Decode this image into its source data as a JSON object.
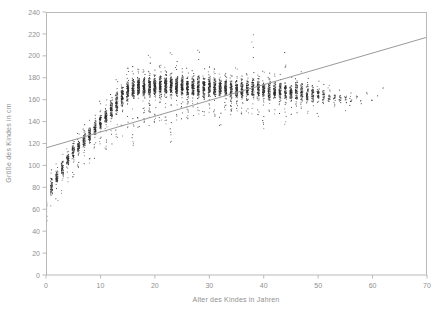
{
  "figure": {
    "background_color": "#ffffff",
    "frame_color": "#b9b9b9",
    "point_color": "#2b2b2b",
    "line_color": "#9a9a9a",
    "top_cut_text": "",
    "plot_area": {
      "left": 46,
      "top": 12,
      "right": 427,
      "bottom": 275
    }
  },
  "chart_data": {
    "type": "scatter",
    "title": "",
    "subtitle": "",
    "xlabel": "Alter des Kindes in Jahren",
    "ylabel": "Größe des Kindes in cm",
    "xlim": [
      0,
      70
    ],
    "ylim": [
      0,
      240
    ],
    "xticks": [
      0,
      10,
      20,
      30,
      40,
      50,
      60,
      70
    ],
    "yticks": [
      0,
      20,
      40,
      60,
      80,
      100,
      120,
      140,
      160,
      180,
      200,
      220,
      240
    ],
    "xticklabels": [
      "0",
      "10",
      "20",
      "30",
      "40",
      "50",
      "60",
      "70"
    ],
    "yticklabels": [
      "0",
      "20",
      "40",
      "60",
      "80",
      "100",
      "120",
      "140",
      "160",
      "180",
      "200",
      "220",
      "240"
    ],
    "grid": false,
    "legend": null,
    "legend_position": "none",
    "series": [
      {
        "name": "Größe nach Alter",
        "type": "scatter",
        "marker": "point",
        "color": "#2b2b2b",
        "note": "Dichte vertikale Punktwolken bei ganzzahligen Altersjahren; Streuung je Alter als [Alter, min_cm, max_cm, dichte_min_cm, dichte_max_cm, n_punkte]",
        "columns": [
          "age",
          "min",
          "max",
          "core_min",
          "core_max",
          "n"
        ],
        "bins": [
          [
            0,
            38,
            82,
            46,
            78,
            60
          ],
          [
            1,
            62,
            96,
            70,
            92,
            55
          ],
          [
            2,
            67,
            104,
            78,
            100,
            58
          ],
          [
            3,
            74,
            112,
            86,
            108,
            56
          ],
          [
            4,
            84,
            120,
            94,
            116,
            60
          ],
          [
            5,
            88,
            131,
            100,
            124,
            62
          ],
          [
            6,
            94,
            133,
            106,
            128,
            60
          ],
          [
            7,
            98,
            138,
            112,
            134,
            64
          ],
          [
            8,
            101,
            145,
            116,
            140,
            66
          ],
          [
            9,
            106,
            152,
            122,
            146,
            70
          ],
          [
            10,
            110,
            160,
            128,
            152,
            74
          ],
          [
            11,
            114,
            166,
            132,
            158,
            78
          ],
          [
            12,
            118,
            172,
            138,
            164,
            84
          ],
          [
            13,
            120,
            179,
            142,
            172,
            90
          ],
          [
            14,
            124,
            184,
            148,
            178,
            96
          ],
          [
            15,
            126,
            189,
            152,
            182,
            100
          ],
          [
            16,
            117,
            192,
            154,
            186,
            104
          ],
          [
            17,
            132,
            193,
            156,
            187,
            108
          ],
          [
            18,
            134,
            196,
            156,
            188,
            112
          ],
          [
            19,
            136,
            202,
            157,
            188,
            112
          ],
          [
            20,
            138,
            196,
            157,
            188,
            112
          ],
          [
            21,
            140,
            194,
            157,
            188,
            110
          ],
          [
            22,
            136,
            198,
            157,
            188,
            110
          ],
          [
            23,
            118,
            212,
            157,
            189,
            110
          ],
          [
            24,
            140,
            196,
            157,
            188,
            108
          ],
          [
            25,
            142,
            192,
            157,
            188,
            106
          ],
          [
            26,
            142,
            190,
            156,
            187,
            104
          ],
          [
            27,
            144,
            193,
            156,
            187,
            102
          ],
          [
            28,
            144,
            206,
            156,
            187,
            100
          ],
          [
            29,
            138,
            191,
            156,
            186,
            98
          ],
          [
            30,
            142,
            190,
            156,
            186,
            96
          ],
          [
            31,
            144,
            189,
            156,
            186,
            94
          ],
          [
            32,
            134,
            188,
            156,
            185,
            92
          ],
          [
            33,
            145,
            188,
            156,
            185,
            90
          ],
          [
            34,
            146,
            187,
            156,
            185,
            88
          ],
          [
            35,
            146,
            190,
            155,
            185,
            86
          ],
          [
            36,
            146,
            188,
            155,
            184,
            84
          ],
          [
            37,
            147,
            186,
            155,
            184,
            82
          ],
          [
            38,
            146,
            223,
            155,
            184,
            82
          ],
          [
            39,
            145,
            189,
            155,
            184,
            80
          ],
          [
            40,
            131,
            192,
            154,
            183,
            80
          ],
          [
            41,
            146,
            185,
            154,
            183,
            78
          ],
          [
            42,
            146,
            187,
            154,
            182,
            76
          ],
          [
            43,
            147,
            186,
            154,
            182,
            74
          ],
          [
            44,
            135,
            205,
            154,
            182,
            72
          ],
          [
            45,
            146,
            185,
            153,
            181,
            70
          ],
          [
            46,
            147,
            184,
            153,
            181,
            66
          ],
          [
            47,
            148,
            186,
            153,
            180,
            62
          ],
          [
            48,
            146,
            181,
            153,
            178,
            56
          ],
          [
            49,
            148,
            180,
            153,
            177,
            50
          ],
          [
            50,
            139,
            179,
            152,
            175,
            42
          ],
          [
            51,
            149,
            174,
            153,
            172,
            28
          ],
          [
            52,
            150,
            173,
            154,
            170,
            22
          ],
          [
            53,
            151,
            170,
            154,
            168,
            16
          ],
          [
            54,
            150,
            172,
            154,
            168,
            14
          ],
          [
            55,
            142,
            171,
            153,
            168,
            12
          ],
          [
            56,
            153,
            169,
            155,
            167,
            8
          ],
          [
            57,
            157,
            166,
            158,
            165,
            4
          ],
          [
            58,
            155,
            164,
            156,
            163,
            3
          ],
          [
            59,
            161,
            171,
            162,
            170,
            3
          ],
          [
            60,
            159,
            160,
            159,
            160,
            2
          ],
          [
            61,
            163,
            164,
            163,
            164,
            1
          ],
          [
            62,
            170,
            171,
            170,
            171,
            2
          ]
        ]
      },
      {
        "name": "Regressionsgerade",
        "type": "line",
        "color": "#9a9a9a",
        "x": [
          0,
          70
        ],
        "y": [
          116,
          217
        ]
      }
    ]
  }
}
